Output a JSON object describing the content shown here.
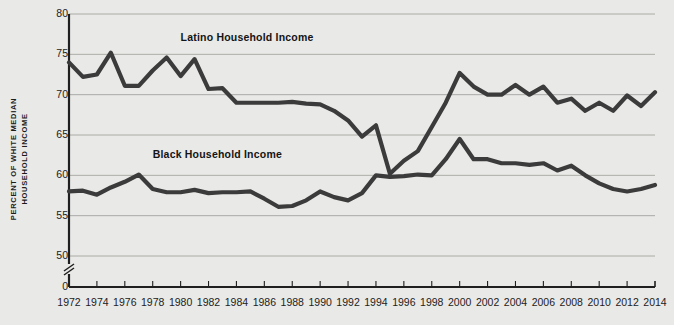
{
  "chart_data": {
    "type": "line",
    "title": "",
    "xlabel": "",
    "ylabel": "PERCENT OF WHITE MEDIAN HOUSEHOLD INCOME",
    "ylabel_line1": "PERCENT OF WHITE MEDIAN",
    "ylabel_line2": "HOUSEHOLD INCOME",
    "xlim": [
      1972,
      2014
    ],
    "ylim": [
      48,
      80
    ],
    "grid": true,
    "grid_axis": "y",
    "axis_break": true,
    "axis_break_label": "0",
    "legend_position": "inline",
    "line_color": "#3b3b3b",
    "background_color": "#e9e9e7",
    "grid_color": "#9a9a98",
    "axis_color": "#1f1f1f",
    "yticks": [
      80,
      75,
      70,
      65,
      60,
      55,
      50,
      0
    ],
    "xticks": [
      1972,
      1974,
      1976,
      1978,
      1980,
      1982,
      1984,
      1986,
      1988,
      1990,
      1992,
      1994,
      1996,
      1998,
      2000,
      2002,
      2004,
      2006,
      2008,
      2010,
      2012,
      2014
    ],
    "x": [
      1972,
      1973,
      1974,
      1975,
      1976,
      1977,
      1978,
      1979,
      1980,
      1981,
      1982,
      1983,
      1984,
      1985,
      1986,
      1987,
      1988,
      1989,
      1990,
      1991,
      1992,
      1993,
      1994,
      1995,
      1996,
      1997,
      1998,
      1999,
      2000,
      2001,
      2002,
      2003,
      2004,
      2005,
      2006,
      2007,
      2008,
      2009,
      2010,
      2011,
      2012,
      2013,
      2014
    ],
    "series": [
      {
        "name": "Latino Household Income",
        "label": "Latino Household Income",
        "color": "#3b3b3b",
        "values": [
          74.0,
          72.2,
          72.5,
          75.2,
          71.1,
          71.1,
          73.0,
          74.6,
          72.3,
          74.4,
          70.7,
          70.8,
          69.0,
          69.0,
          69.0,
          69.0,
          69.1,
          68.9,
          68.8,
          68.0,
          66.8,
          64.8,
          66.2,
          60.2,
          61.8,
          63.0,
          66.0,
          69.0,
          72.7,
          71.0,
          70.0,
          70.0,
          71.2,
          70.0,
          71.0,
          69.0,
          69.5,
          68.0,
          69.0,
          68.0,
          69.9,
          68.6,
          70.3
        ]
      },
      {
        "name": "Black Household Income",
        "label": "Black Household Income",
        "color": "#3b3b3b",
        "values": [
          58.0,
          58.1,
          57.6,
          58.5,
          59.2,
          60.1,
          58.3,
          57.9,
          57.9,
          58.2,
          57.8,
          57.9,
          57.9,
          58.0,
          57.1,
          56.1,
          56.2,
          56.9,
          58.0,
          57.3,
          56.9,
          57.8,
          60.0,
          59.8,
          59.9,
          60.1,
          60.0,
          62.0,
          64.5,
          62.0,
          62.0,
          61.5,
          61.5,
          61.3,
          61.5,
          60.6,
          61.2,
          60.0,
          59.0,
          58.3,
          58.0,
          58.3,
          58.8
        ]
      }
    ],
    "annotations": [
      {
        "text": "Latino Household Income",
        "x": 1980,
        "y": 77.0
      },
      {
        "text": "Black Household Income",
        "x": 1978,
        "y": 62.5
      }
    ]
  }
}
